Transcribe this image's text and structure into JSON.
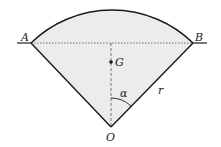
{
  "diagram": {
    "type": "circular-sector-centroid",
    "labels": {
      "A": "A",
      "B": "B",
      "G": "G",
      "O": "O",
      "alpha": "α",
      "r": "r"
    },
    "colors": {
      "fill": "#ececec",
      "stroke": "#1a1a1a",
      "dashed": "#555555"
    }
  }
}
